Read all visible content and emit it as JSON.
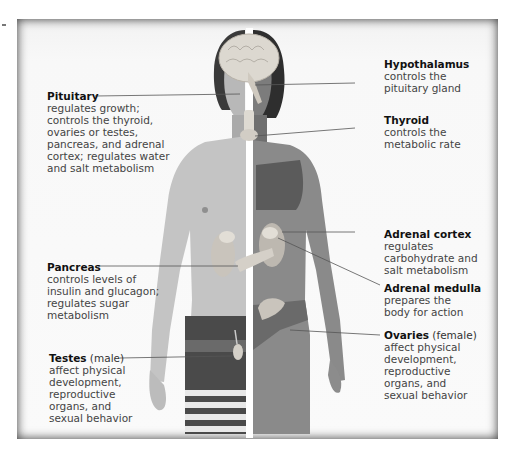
{
  "diagram": {
    "colors": {
      "skin_light": "#c9c9c9",
      "skin_dark": "#8a8a8a",
      "hair": "#3a3a3a",
      "brain": "#d9d6d0",
      "organ": "#cfcac3",
      "bikini": "#5b5b5b",
      "divider": "#ffffff",
      "leader": "#555555"
    },
    "labels": [
      {
        "id": "pituitary",
        "title": "Pituitary",
        "qualifier": "",
        "description": "regulates growth;\ncontrols the thyroid,\novaries or testes,\npancreas, and adrenal\ncortex; regulates water\nand salt metabolism"
      },
      {
        "id": "hypothalamus",
        "title": "Hypothalamus",
        "qualifier": "",
        "description": "controls the\npituitary gland"
      },
      {
        "id": "thyroid",
        "title": "Thyroid",
        "qualifier": "",
        "description": "controls the\nmetabolic rate"
      },
      {
        "id": "adrenal_cortex",
        "title": "Adrenal cortex",
        "qualifier": "",
        "description": "regulates\ncarbohydrate and\nsalt metabolism"
      },
      {
        "id": "adrenal_medulla",
        "title": "Adrenal medulla",
        "qualifier": "",
        "description": "prepares the\nbody for action"
      },
      {
        "id": "pancreas",
        "title": "Pancreas",
        "qualifier": "",
        "description": "controls levels of\ninsulin and glucagon;\nregulates sugar\nmetabolism"
      },
      {
        "id": "ovaries",
        "title": "Ovaries",
        "qualifier": " (female)",
        "description": "affect physical\ndevelopment,\nreproductive\norgans, and\nsexual behavior"
      },
      {
        "id": "testes",
        "title": "Testes",
        "qualifier": " (male)",
        "description": "affect physical\ndevelopment,\nreproductive\norgans, and\nsexual behavior"
      }
    ]
  }
}
